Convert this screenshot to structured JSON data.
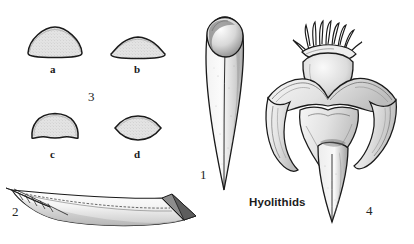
{
  "plate": {
    "caption": "Hyolithids",
    "background_color": "#ffffff",
    "ink_color": "#1a1a1a",
    "fill_color": "#dcdcdc",
    "width": 414,
    "height": 244
  },
  "figures": [
    {
      "number": "1",
      "name": "conical-shell-with-operculum",
      "description": "Elongate conical hyolith shell in dorsal view with operculum at the apertural end",
      "label_x": 200,
      "label_y": 175
    },
    {
      "number": "2",
      "name": "curved-shell-lateral-view",
      "description": "Curved elongate hyolith conch in lateral view showing ligula and growth lines",
      "label_x": 12,
      "label_y": 212
    },
    {
      "number": "3",
      "name": "cross-section-group",
      "description": "Group of four transverse cross-sections of hyolith conchs",
      "label_x": 88,
      "label_y": 90
    },
    {
      "number": "4",
      "name": "life-reconstruction",
      "description": "Life reconstruction of a hyolithid with tentacle crown and flared mantle lobes",
      "label_x": 368,
      "label_y": 206
    }
  ],
  "cross_sections": [
    {
      "letter": "a",
      "name": "section-rounded-triangular",
      "shape": "rounded triangular, broadly convex dorsum with flat venter",
      "label_x": 50,
      "label_y": 66
    },
    {
      "letter": "b",
      "name": "section-low-dome",
      "shape": "low wide dome with gently convex base",
      "label_x": 134,
      "label_y": 66
    },
    {
      "letter": "c",
      "name": "section-trapezoidal",
      "shape": "trapezoidal / bell-shaped with concave venter",
      "label_x": 50,
      "label_y": 151
    },
    {
      "letter": "d",
      "name": "section-lenticular",
      "shape": "lenticular, pointed at both lateral margins",
      "label_x": 134,
      "label_y": 151
    }
  ]
}
